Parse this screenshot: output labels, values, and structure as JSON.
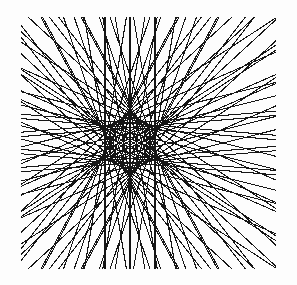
{
  "figure": {
    "title": "Deltoid envelope of lines",
    "alt_names": [
      "Steiner curve",
      "tricuspoid",
      "three-cusped hypocycloid",
      "Simson line envelope"
    ],
    "background_color": "#fdfdfd",
    "line_color": "#161616",
    "line_width": 1.05
  },
  "chart_data": {
    "type": "line",
    "title": "Deltoid envelope of lines",
    "xlabel": "",
    "ylabel": "",
    "xlim": [
      0,
      297
    ],
    "ylim": [
      0,
      285
    ],
    "grid": false,
    "legend": "none",
    "curve": {
      "name": "deltoid",
      "cusp_count": 3,
      "cusps_px": [
        {
          "label": "upper-left-cusp",
          "x": 93,
          "y": 50
        },
        {
          "label": "lower-left-cusp",
          "x": 93,
          "y": 232
        },
        {
          "label": "right-cusp",
          "x": 205,
          "y": 143
        }
      ],
      "center_px": {
        "x": 130,
        "y": 143
      },
      "radius_a_px": 25.0,
      "orientation_deg": 0
    },
    "frame_px": {
      "left": 21,
      "top": 17,
      "right": 276,
      "bottom": 269
    },
    "lines": {
      "count": 76,
      "parameter_name": "t",
      "parameter_start_deg": 0,
      "parameter_step_deg": 4.7368,
      "family": "tangent lines to deltoid: x*cos(2t) + y*sin(2t) = a*cos(3t)",
      "note": "Each straight segment is tangent to the deltoid and clipped to the square frame."
    },
    "series": [
      {
        "name": "tangent-line-family",
        "values": [
          76
        ],
        "color": "#161616"
      }
    ]
  }
}
